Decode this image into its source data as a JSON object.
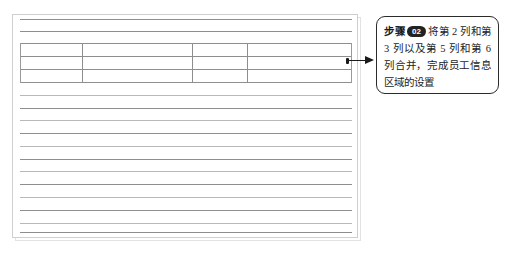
{
  "figure": {
    "name": "worksheet-table-illustration",
    "row_count": 17,
    "row_lines_y": [
      0,
      12,
      24,
      37,
      50,
      63,
      76,
      89,
      101,
      114,
      127,
      140,
      152,
      165,
      178,
      191,
      204,
      213
    ],
    "merged_band": {
      "top_row_index": 2,
      "bottom_row_index": 5,
      "column_divider_x": [
        62,
        172,
        227,
        325
      ],
      "left_x": 0,
      "right_x": 332
    },
    "grid_color": "#8e8e8e",
    "frame_color": "#cfcfcf"
  },
  "arrow": {
    "name": "pointer-arrow",
    "direction": "left",
    "color": "#1a1a1a"
  },
  "callout": {
    "step_label": "步骤",
    "step_number": "02",
    "text": "将第 2 列和第 3 列以及第 5 列和第 6 列合并，完成员工信息区域的设置",
    "border_color": "#2b2b2b",
    "badge_background": "#222222",
    "badge_text_color": "#ffffff"
  }
}
